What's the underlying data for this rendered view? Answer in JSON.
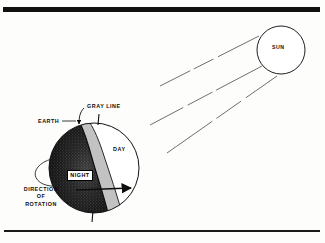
{
  "figure": {
    "kind": "diagram",
    "background_color": "#fdfdfc",
    "ink_color": "#0d0d0d"
  },
  "rules": {
    "top": {
      "name": "top-rule",
      "thickness_px": 5,
      "color": "#111111"
    },
    "bottom": {
      "name": "bottom-rule",
      "thickness_px": 2,
      "color": "#1a1a1a"
    }
  },
  "sun": {
    "label": "SUN",
    "shape": "circle",
    "center_x": 281,
    "center_y": 50,
    "radius": 24,
    "stroke_color": "#111111"
  },
  "rays": {
    "name": "sunlight-rays",
    "count": 3,
    "style": "dashed",
    "color": "#4a4a4a",
    "direction": "from-sun-down-left"
  },
  "earth": {
    "label": "EARTH",
    "shape": "circle",
    "center_x": 94,
    "center_y": 168,
    "radius": 45,
    "stroke_color": "#111111",
    "night_label": "NIGHT",
    "day_label": "DAY",
    "terminator_label": "GRAY LINE",
    "night_fill": "#111111",
    "terminator_fill": "#b9b9b9",
    "day_fill": "#ffffff"
  },
  "rotation": {
    "label_lines": [
      "DIRECTION",
      "OF",
      "ROTATION"
    ],
    "label_text": "DIRECTION OF ROTATION",
    "arrow_direction": "east",
    "orbit_ellipse": true
  },
  "axis": {
    "name": "earth-rotation-axis",
    "north_pole_tick": true,
    "south_pole_tick": true
  }
}
